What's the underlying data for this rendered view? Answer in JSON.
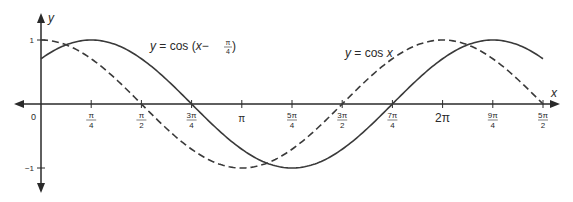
{
  "chart_data": {
    "type": "line",
    "title": "",
    "xlabel": "x",
    "ylabel": "y",
    "xlim_radians": [
      0,
      7.853981634
    ],
    "ylim": [
      -1,
      1
    ],
    "grid": false,
    "legend_position": "inline labels near curves",
    "x_ticks": [
      {
        "value": 0.785398,
        "num": "π",
        "den": "4"
      },
      {
        "value": 1.570796,
        "num": "π",
        "den": "2"
      },
      {
        "value": 2.356194,
        "num": "3π",
        "den": "4"
      },
      {
        "value": 3.141593,
        "label": "π"
      },
      {
        "value": 3.926991,
        "num": "5π",
        "den": "4"
      },
      {
        "value": 4.712389,
        "num": "3π",
        "den": "2"
      },
      {
        "value": 5.497787,
        "num": "7π",
        "den": "4"
      },
      {
        "value": 6.283185,
        "label": "2π"
      },
      {
        "value": 7.068583,
        "num": "9π",
        "den": "4"
      },
      {
        "value": 7.853982,
        "num": "5π",
        "den": "2"
      }
    ],
    "origin_label": "0",
    "y_ticks": [
      {
        "value": 1,
        "label": "1"
      },
      {
        "value": -1,
        "label": "−1"
      }
    ],
    "series": [
      {
        "name": "y = cos(x − π/4)",
        "label_parts": {
          "pre": "y",
          "mid": " = cos (",
          "var": "x",
          "minus": "−",
          "num": "π",
          "den": "4",
          "post": " )"
        },
        "style": "solid",
        "phase_shift": 0.785398,
        "x": [
          0,
          0.785398,
          1.570796,
          2.356194,
          3.141593,
          3.926991,
          4.712389,
          5.497787,
          6.283185,
          7.068583,
          7.853982
        ],
        "values": [
          0.707,
          1,
          0.707,
          0,
          -0.707,
          -1,
          -0.707,
          0,
          0.707,
          1,
          0.707
        ]
      },
      {
        "name": "y = cos x",
        "label_parts": {
          "pre": "y",
          "mid": " = cos ",
          "var": "x"
        },
        "style": "dashed",
        "phase_shift": 0,
        "x": [
          0,
          0.785398,
          1.570796,
          2.356194,
          3.141593,
          3.926991,
          4.712389,
          5.497787,
          6.283185,
          7.068583,
          7.853982
        ],
        "values": [
          1,
          0.707,
          0,
          -0.707,
          -1,
          -0.707,
          0,
          0.707,
          1,
          0.707,
          0
        ]
      }
    ],
    "colors": {
      "curve": "#3a3a3a",
      "axis": "#2a2a2a",
      "background": "#ffffff"
    }
  }
}
